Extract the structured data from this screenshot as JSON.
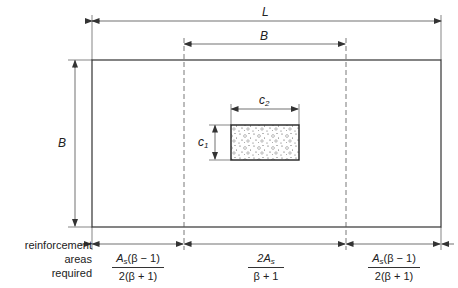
{
  "diagram": {
    "type": "footing-reinforcement-distribution",
    "dimensions": {
      "length_label": "L",
      "top_width_label": "B",
      "side_width_label": "B",
      "column_c1_label": "c",
      "column_c1_sub": "1",
      "column_c2_label": "c",
      "column_c2_sub": "2"
    },
    "bottom_row": {
      "caption_lines": [
        "reinforcement",
        "areas",
        "required"
      ],
      "left_band": {
        "num_main": "A",
        "num_sub": "s",
        "num_rest": "(β − 1)",
        "den": "2(β + 1)"
      },
      "center_band": {
        "num_main": "2A",
        "num_sub": "s",
        "num_rest": "",
        "den": "β + 1"
      },
      "right_band": {
        "num_main": "A",
        "num_sub": "s",
        "num_rest": "(β − 1)",
        "den": "2(β + 1)"
      }
    },
    "colors": {
      "line": "#333333",
      "dash": "#555555",
      "background": "#ffffff"
    }
  }
}
